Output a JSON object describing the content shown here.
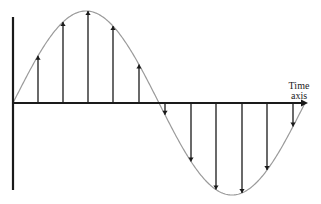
{
  "diagram": {
    "type": "sampled-sine-wave",
    "labels": {
      "time_axis_line1": "Time",
      "time_axis_line2": "axis"
    },
    "colors": {
      "axis": "#1a1a1a",
      "arrows": "#1a1a1a",
      "curve": "#9a9a9a",
      "background": "#ffffff"
    },
    "geometry": {
      "axis_y": 103,
      "vertical_axis_x": 13,
      "vertical_axis_top": 17,
      "vertical_axis_bottom": 190,
      "horizontal_axis_start": 13,
      "horizontal_axis_end": 308,
      "curve_start_x": 13,
      "curve_end_x": 305,
      "amplitude_px": 92
    },
    "samples": [
      {
        "x": 38,
        "direction": "up"
      },
      {
        "x": 63,
        "direction": "up"
      },
      {
        "x": 88,
        "direction": "up"
      },
      {
        "x": 113,
        "direction": "up"
      },
      {
        "x": 139,
        "direction": "up"
      },
      {
        "x": 165,
        "direction": "down"
      },
      {
        "x": 191,
        "direction": "down"
      },
      {
        "x": 216,
        "direction": "down"
      },
      {
        "x": 242,
        "direction": "down"
      },
      {
        "x": 267,
        "direction": "down"
      },
      {
        "x": 293,
        "direction": "down"
      }
    ]
  }
}
